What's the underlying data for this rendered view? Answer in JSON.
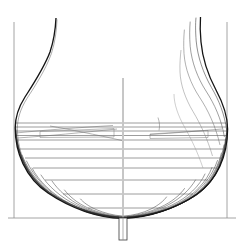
{
  "drawing": {
    "title": "Ship Body Plan (Lines Drawing)",
    "type": "naval-architecture-body-plan",
    "background_color": "#ffffff",
    "line_color": "#1a1a1a",
    "faint_line_color": "#8a8a8a",
    "mid_line_color": "#555555",
    "canvas": {
      "width": 244,
      "height": 250
    }
  },
  "geometry": {
    "centerline_x": 123.0,
    "centerline_top_y": 78.0,
    "centerline_bottom_y": 240.0,
    "baseline_y": 218.0,
    "baseline_x_start": 8.0,
    "baseline_x_end": 236.0,
    "left_frame_x": 14.0,
    "right_frame_x": 227.0,
    "frame_top_y": 22.0,
    "frame_bottom_y": 218.0,
    "keel_box": {
      "x": 119.0,
      "y": 218.0,
      "width": 8.0,
      "height": 22.0
    },
    "max_beam_left_x": 16.0,
    "max_beam_right_x": 226.0,
    "deck_top_y": 18.0
  },
  "waterlines": {
    "label": "waterlines",
    "count": 11,
    "y_values": [
      123.0,
      127.0,
      131.0,
      135.5,
      140.0,
      149.0,
      158.0,
      168.0,
      180.0,
      194.0,
      208.0
    ],
    "left_extents": [
      [
        16.0,
        122.0
      ],
      [
        15.5,
        122.0
      ],
      [
        15.5,
        122.0
      ],
      [
        16.0,
        122.0
      ],
      [
        17.0,
        122.0
      ],
      [
        20.0,
        122.0
      ],
      [
        25.0,
        122.0
      ],
      [
        33.0,
        122.0
      ],
      [
        45.0,
        122.0
      ],
      [
        63.0,
        122.0
      ],
      [
        88.0,
        122.0
      ]
    ],
    "right_extents": [
      [
        124.0,
        226.0
      ],
      [
        124.0,
        226.5
      ],
      [
        124.0,
        227.0
      ],
      [
        124.0,
        227.0
      ],
      [
        124.0,
        226.5
      ],
      [
        124.0,
        225.0
      ],
      [
        124.0,
        222.0
      ],
      [
        124.0,
        217.0
      ],
      [
        124.0,
        208.0
      ],
      [
        124.0,
        193.0
      ],
      [
        124.0,
        166.0
      ]
    ]
  },
  "stations_left": {
    "label": "forward body station curves (bow half)",
    "count": 13,
    "description": "V-shaped fine entry sections sweeping from keel to topside"
  },
  "stations_right": {
    "label": "after body station curves (stern half)",
    "count": 12,
    "description": "Full rounded bilge sections with flared topsides"
  },
  "topside_curves_left": {
    "label": "left sheer / topside profile",
    "count": 1
  },
  "topside_curves_right": {
    "label": "right flared topside profiles",
    "count": 4
  },
  "diagonals": {
    "label": "diagonal construction lines",
    "left_count": 3,
    "right_count": 2
  },
  "shelves": {
    "left": {
      "x": 40.0,
      "y": 128.0,
      "width": 74.0,
      "height": 9.0,
      "label": "left deck shelf outline"
    },
    "right": {
      "x": 150.0,
      "y": 130.0,
      "width": 58.0,
      "height": 8.0,
      "label": "right deck shelf outline"
    }
  }
}
